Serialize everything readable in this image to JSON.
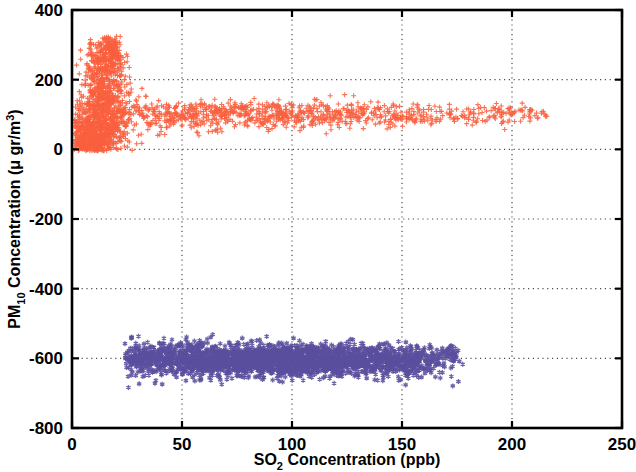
{
  "chart_data": {
    "type": "scatter",
    "title": "",
    "xlabel": "SO_2 Concentration (ppb)",
    "xlabel_parts": {
      "pre": "SO",
      "sub": "2",
      "post": " Concentration (ppb)"
    },
    "ylabel": "PM_10 Concentration (μ gr/m^3)",
    "ylabel_parts": {
      "pre": "PM",
      "sub": "10",
      "mid": " Concentration (μ gr/m",
      "sup": "3",
      "post": ")"
    },
    "xlim": [
      0,
      250
    ],
    "ylim": [
      -800,
      400
    ],
    "xticks": [
      0,
      50,
      100,
      150,
      200,
      250
    ],
    "xtick_labels": [
      "0",
      "50",
      "100",
      "150",
      "200",
      "250"
    ],
    "yticks": [
      -800,
      -600,
      -400,
      -200,
      0,
      200,
      400
    ],
    "ytick_labels": [
      "-800",
      "-600",
      "-400",
      "-200",
      "0",
      "200",
      "400"
    ],
    "grid": true,
    "grid_style": "dotted",
    "grid_color": "#4d4d4d",
    "legend": null,
    "axis_color": "#000000",
    "background": "#ffffff",
    "series": [
      {
        "name": "PM10 upper cluster",
        "marker": "plus",
        "color": "#f9603f",
        "marker_size": 5,
        "description": "Dense vertical plume at low SO2 (2-25 ppb) reaching PM10 ~320, with a long horizontal band near PM10 ~70-130 extending to SO2 ~215 ppb",
        "n_points": 2600,
        "x_range": [
          1,
          216
        ],
        "y_range": [
          -5,
          325
        ],
        "clusters": [
          {
            "cx": 12,
            "cy": 60,
            "sx": 6.5,
            "sy": 45,
            "n": 620,
            "type": "gauss"
          },
          {
            "cx": 15,
            "cy": 160,
            "sx": 5.0,
            "sy": 55,
            "n": 380,
            "type": "gauss"
          },
          {
            "cx": 13,
            "cy": 255,
            "sx": 3.2,
            "sy": 35,
            "n": 150,
            "type": "gauss"
          },
          {
            "cx": 19,
            "cy": 265,
            "sx": 2.6,
            "sy": 38,
            "n": 130,
            "type": "gauss"
          },
          {
            "cx": 17,
            "cy": 300,
            "sx": 2.4,
            "sy": 16,
            "n": 55,
            "type": "gauss"
          },
          {
            "cx": 9,
            "cy": 20,
            "sx": 5.5,
            "sy": 16,
            "n": 260,
            "type": "gauss"
          },
          {
            "cx": 55,
            "cy": 100,
            "sx": 28,
            "sy": 22,
            "n": 420,
            "type": "gauss"
          },
          {
            "cx": 105,
            "cy": 98,
            "sx": 30,
            "sy": 19,
            "n": 330,
            "type": "gauss"
          },
          {
            "cx": 160,
            "cy": 97,
            "sx": 28,
            "sy": 16,
            "n": 180,
            "type": "gauss"
          },
          {
            "cx": 200,
            "cy": 103,
            "sx": 12,
            "sy": 13,
            "n": 75,
            "type": "gauss"
          }
        ]
      },
      {
        "name": "PM10 lower cluster",
        "marker": "asterisk",
        "color": "#5a4f9e",
        "marker_size": 5,
        "description": "Broad horizontal band centered near PM10 = -605 spanning SO2 from ~25 to ~178 ppb",
        "n_points": 3000,
        "x_range": [
          24,
          178
        ],
        "y_range": [
          -690,
          -530
        ],
        "clusters": [
          {
            "cx": 95,
            "cy": -605,
            "sx": 30,
            "sy": 22,
            "n": 2200,
            "type": "gauss"
          },
          {
            "cx": 45,
            "cy": -600,
            "sx": 12,
            "sy": 28,
            "n": 380,
            "type": "gauss"
          },
          {
            "cx": 150,
            "cy": -607,
            "sx": 12,
            "sy": 24,
            "n": 330,
            "type": "gauss"
          },
          {
            "cx": 172,
            "cy": -588,
            "sx": 4,
            "sy": 12,
            "n": 30,
            "type": "gauss"
          },
          {
            "cx": 30,
            "cy": -595,
            "sx": 4,
            "sy": 20,
            "n": 40,
            "type": "gauss"
          }
        ]
      }
    ]
  },
  "figure": {
    "plot_box": {
      "left": 72,
      "top": 10,
      "right": 622,
      "bottom": 428
    }
  }
}
